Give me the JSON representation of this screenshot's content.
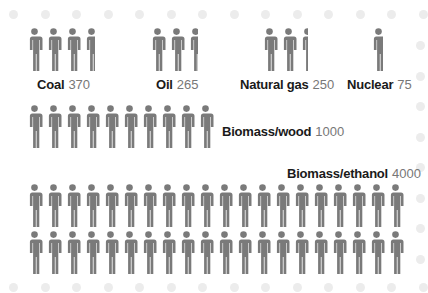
{
  "chart_data": {
    "type": "pictogram",
    "title": "",
    "unit_per_icon": 100,
    "icon": "person-icon",
    "categories": [
      "Coal",
      "Oil",
      "Natural gas",
      "Nuclear",
      "Biomass/wood",
      "Biomass/ethanol"
    ],
    "values": [
      370,
      265,
      250,
      75,
      1000,
      4000
    ],
    "labels": [
      {
        "name": "Coal",
        "value": "370"
      },
      {
        "name": "Oil",
        "value": "265"
      },
      {
        "name": "Natural gas",
        "value": "250"
      },
      {
        "name": "Nuclear",
        "value": "75"
      },
      {
        "name": "Biomass/wood",
        "value": "1000"
      },
      {
        "name": "Biomass/ethanol",
        "value": "4000"
      }
    ],
    "colors": {
      "icon": "#7a7a7a",
      "label": "#1a1a1a",
      "value": "#777777",
      "dots": "#ececec"
    }
  }
}
